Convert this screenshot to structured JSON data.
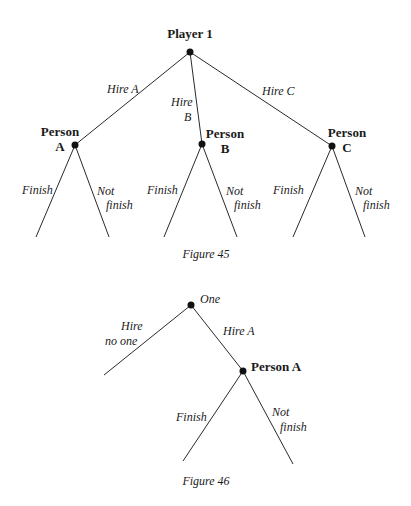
{
  "figures": [
    {
      "caption": "Figure 45",
      "root": {
        "label": "Player 1"
      },
      "root_moves": [
        "Hire A",
        "Hire",
        "B",
        "Hire C"
      ],
      "nodes": [
        {
          "label_line1": "Person",
          "label_line2": "A"
        },
        {
          "label_line1": "Person",
          "label_line2": "B"
        },
        {
          "label_line1": "Person",
          "label_line2": "C"
        }
      ],
      "leaf_moves": {
        "finish": "Finish",
        "not": "Not",
        "finish_lower": "finish"
      }
    },
    {
      "caption": "Figure 46",
      "root": {
        "label": "One"
      },
      "moves": {
        "hire": "Hire",
        "no_one": "no one",
        "hire_a": "Hire A"
      },
      "node": {
        "label": "Person A"
      },
      "leaf_moves": {
        "finish": "Finish",
        "not": "Not",
        "finish_lower": "finish"
      }
    }
  ]
}
